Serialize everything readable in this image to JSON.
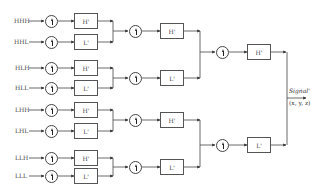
{
  "diagram": {
    "type": "inverse 3D wavelet reconstruction tree",
    "inputs": [
      "HHH",
      "HHL",
      "HLH",
      "HLL",
      "LHH",
      "LHL",
      "LLH",
      "LLL"
    ],
    "stage1_filters": [
      "H'",
      "L'",
      "H'",
      "L'",
      "H'",
      "L'",
      "H'",
      "L'"
    ],
    "stage2_filters": [
      "H'",
      "L'",
      "H'",
      "L'"
    ],
    "stage3_filters": [
      "H'",
      "L'"
    ],
    "upsample_symbol": "↑",
    "output": {
      "label": "Signal'",
      "coords": "(x, y, z)"
    }
  }
}
